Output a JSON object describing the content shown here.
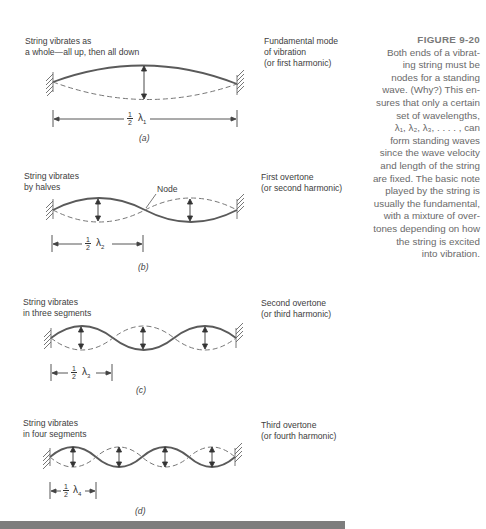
{
  "figure": {
    "title": "FIGURE 9-20",
    "caption": "Both ends of a vibrating string must be nodes for a standing wave. (Why?) This ensures that only a certain set of wavelengths, λ₁, λ₂, λ₃, . . . . , can form standing waves since the wave velocity and length of the string are fixed. The basic note played by the string is usually the fundamental, with a mixture of overtones depending on how the string is excited into vibration.",
    "caption_lines": [
      "Both ends of a vibrat-",
      "ing string must be",
      "nodes for a standing",
      "wave. (Why?) This en-",
      "sures that only a certain",
      "set of wavelengths,",
      "λ₁, λ₂, λ₃, . . . . , can",
      "form standing waves",
      "since the wave velocity",
      "and length of the string",
      "are fixed. The basic note",
      "played by the string is",
      "usually the fundamental,",
      "with a mixture of over-",
      "tones depending on how",
      "the string is excited",
      "into vibration."
    ]
  },
  "panels": [
    {
      "label": "(a)",
      "description": [
        "String vibrates as",
        "a whole—all up, then all down"
      ],
      "mode": [
        "Fundamental mode",
        "of vibration",
        "(or first harmonic)"
      ],
      "dimension": {
        "fraction_num": "1",
        "fraction_den": "2",
        "symbol": "λ",
        "subscript": "1"
      },
      "segments": 1
    },
    {
      "label": "(b)",
      "description": [
        "String vibrates",
        "by halves"
      ],
      "mode": [
        "First overtone",
        "(or second harmonic)"
      ],
      "node_label": "Node",
      "dimension": {
        "fraction_num": "1",
        "fraction_den": "2",
        "symbol": "λ",
        "subscript": "2"
      },
      "segments": 2
    },
    {
      "label": "(c)",
      "description": [
        "String vibrates",
        "in three segments"
      ],
      "mode": [
        "Second overtone",
        "(or third harmonic)"
      ],
      "dimension": {
        "fraction_num": "1",
        "fraction_den": "2",
        "symbol": "λ",
        "subscript": "3"
      },
      "segments": 3
    },
    {
      "label": "(d)",
      "description": [
        "String vibrates",
        "in four segments"
      ],
      "mode": [
        "Third overtone",
        "(or fourth harmonic)"
      ],
      "dimension": {
        "fraction_num": "1",
        "fraction_den": "2",
        "symbol": "λ",
        "subscript": "4"
      },
      "segments": 4
    }
  ],
  "colors": {
    "string": "#5a5a5a",
    "text": "#3d3d3d",
    "caption": "#6a6a6a",
    "bottom_bar": "#7d7d7d"
  }
}
